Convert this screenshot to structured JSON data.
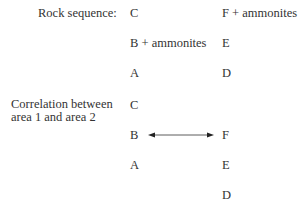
{
  "rock_sequence": {
    "label": "Rock sequence:",
    "area1": [
      "C",
      "B + ammonites",
      "A"
    ],
    "area2": [
      "F + ammonites",
      "E",
      "D"
    ]
  },
  "correlation": {
    "label_line1": "Correlation between",
    "label_line2": "area 1 and area 2",
    "area1": [
      "C",
      "B",
      "A"
    ],
    "area2": [
      "F",
      "E",
      "D"
    ],
    "link": {
      "from": "B",
      "to": "F",
      "type": "double-arrow"
    }
  }
}
